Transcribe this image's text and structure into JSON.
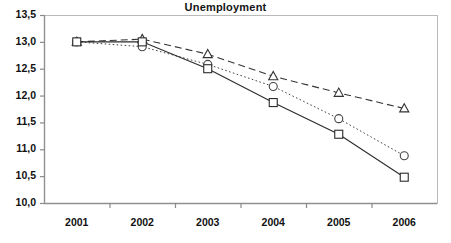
{
  "chart_data": {
    "type": "line",
    "title": "Unemployment",
    "xlabel": "",
    "ylabel": "",
    "categories": [
      "2001",
      "2002",
      "2003",
      "2004",
      "2005",
      "2006"
    ],
    "ylim": [
      10.0,
      13.5
    ],
    "ytick_labels": [
      "13,5",
      "13,0",
      "12,5",
      "12,0",
      "11,5",
      "11,0",
      "10,5",
      "10,0"
    ],
    "ytick_values": [
      13.5,
      13.0,
      12.5,
      12.0,
      11.5,
      11.0,
      10.5,
      10.0
    ],
    "grid": false,
    "legend_position": "none",
    "decimal_separator": ",",
    "series": [
      {
        "name": "series-triangle",
        "marker": "triangle",
        "line_style": "dashed",
        "color": "#333333",
        "values": [
          13.0,
          13.05,
          12.77,
          12.36,
          12.05,
          11.76
        ]
      },
      {
        "name": "series-circle",
        "marker": "circle",
        "line_style": "dotted",
        "color": "#444444",
        "values": [
          13.0,
          12.91,
          12.58,
          12.17,
          11.57,
          10.88
        ]
      },
      {
        "name": "series-square",
        "marker": "square",
        "line_style": "solid",
        "color": "#2b2b2b",
        "values": [
          13.0,
          13.0,
          12.5,
          11.87,
          11.28,
          10.48
        ]
      }
    ]
  },
  "axis": {
    "border_color": "#b9b9b9",
    "tick_color": "#8a8a8a"
  }
}
